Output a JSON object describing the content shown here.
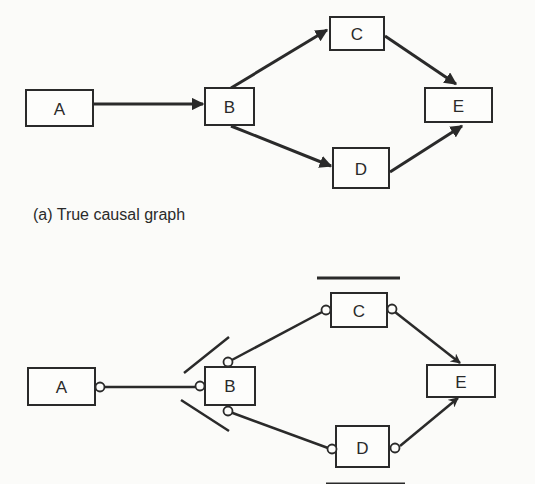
{
  "figure": {
    "panel_a": {
      "caption": "(a) True causal graph",
      "nodes": [
        {
          "id": "A",
          "label": "A"
        },
        {
          "id": "B",
          "label": "B"
        },
        {
          "id": "C",
          "label": "C"
        },
        {
          "id": "D",
          "label": "D"
        },
        {
          "id": "E",
          "label": "E"
        }
      ],
      "edges": [
        {
          "from": "A",
          "to": "B",
          "type": "directed"
        },
        {
          "from": "B",
          "to": "C",
          "type": "directed"
        },
        {
          "from": "B",
          "to": "D",
          "type": "directed"
        },
        {
          "from": "C",
          "to": "E",
          "type": "directed"
        },
        {
          "from": "D",
          "to": "E",
          "type": "directed"
        }
      ]
    },
    "panel_b": {
      "nodes": [
        {
          "id": "A",
          "label": "A"
        },
        {
          "id": "B",
          "label": "B"
        },
        {
          "id": "C",
          "label": "C"
        },
        {
          "id": "D",
          "label": "D"
        },
        {
          "id": "E",
          "label": "E"
        }
      ],
      "edges": [
        {
          "from": "A",
          "to": "B",
          "type": "circle-circle"
        },
        {
          "from": "B",
          "to": "C",
          "type": "circle-circle"
        },
        {
          "from": "B",
          "to": "D",
          "type": "circle-circle"
        },
        {
          "from": "C",
          "to": "E",
          "type": "circle-arrow"
        },
        {
          "from": "D",
          "to": "E",
          "type": "circle-arrow"
        }
      ],
      "annotations": [
        "bar-above-C",
        "bar-below-D",
        "slashes-at-B"
      ]
    }
  }
}
